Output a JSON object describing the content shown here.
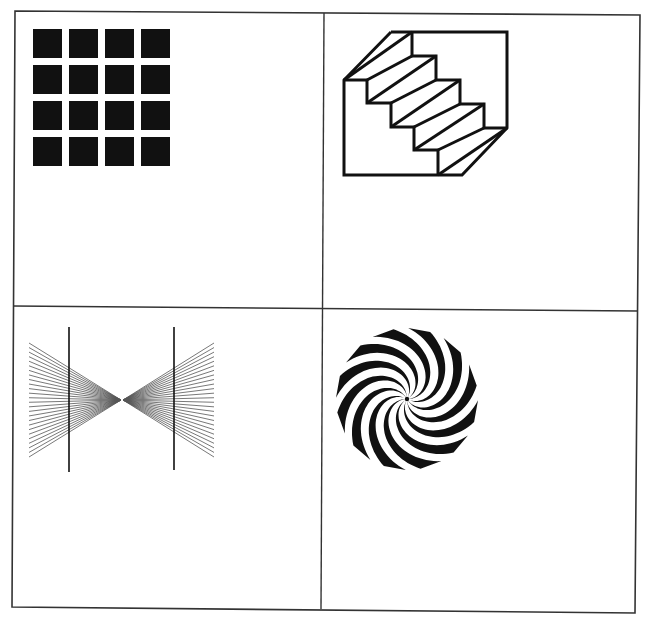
{
  "figure": {
    "title": "Four optical illusion figures",
    "panels": [
      {
        "id": "grid",
        "label": "Hermann grid illusion"
      },
      {
        "id": "staircase",
        "label": "Schroeder staircase illusion"
      },
      {
        "id": "fan",
        "label": "Hering illusion"
      },
      {
        "id": "spiral",
        "label": "Fraser spiral / twisted disk"
      }
    ]
  },
  "colors": {
    "ink": "#111111",
    "frame": "#333333",
    "fan_lines": "#555555",
    "background": "#ffffff"
  },
  "frame": {
    "corners": [
      [
        15,
        11
      ],
      [
        640,
        15
      ],
      [
        635,
        613
      ],
      [
        12,
        607
      ]
    ],
    "vertical_divider": [
      [
        324,
        13
      ],
      [
        321,
        609
      ]
    ],
    "horizontal_divider": [
      [
        13,
        306
      ],
      [
        638,
        311
      ]
    ],
    "underline": {
      "from": [
        10,
        617
      ],
      "to": [
        480,
        617
      ],
      "width": 3
    }
  },
  "grid_figure": {
    "rows": 4,
    "cols": 4,
    "origin": [
      33,
      29
    ],
    "square_size": 29,
    "step": 36
  },
  "staircase_figure": {
    "outline": [
      [
        391,
        32
      ],
      [
        507,
        32
      ],
      [
        507,
        128
      ],
      [
        462,
        175
      ],
      [
        344,
        175
      ],
      [
        344,
        80
      ],
      [
        391,
        32
      ]
    ],
    "steps_profile": [
      [
        344,
        80
      ],
      [
        367,
        80
      ],
      [
        367,
        103
      ],
      [
        391,
        103
      ],
      [
        391,
        127
      ],
      [
        414,
        127
      ],
      [
        414,
        150
      ],
      [
        438,
        150
      ],
      [
        438,
        175
      ]
    ],
    "back_profile": [
      [
        412,
        32
      ],
      [
        412,
        56
      ],
      [
        436,
        56
      ],
      [
        436,
        80
      ],
      [
        460,
        80
      ],
      [
        460,
        104
      ],
      [
        484,
        104
      ],
      [
        484,
        128
      ],
      [
        507,
        128
      ]
    ],
    "stroke_width": 3
  },
  "fan_figure": {
    "vertical_lines": [
      {
        "x": 69,
        "y1": 327,
        "y2": 472
      },
      {
        "x": 174,
        "y1": 327,
        "y2": 470
      }
    ],
    "left_fan": {
      "apex": [
        121,
        400
      ],
      "far_x": 29,
      "y_top": 343,
      "y_bottom": 457,
      "count": 26
    },
    "right_fan": {
      "apex": [
        123,
        400
      ],
      "far_x": 214,
      "y_top": 343,
      "y_bottom": 457,
      "count": 26
    }
  },
  "spiral_figure": {
    "center": [
      407,
      399
    ],
    "radius": 71,
    "arms": 12,
    "twist_degrees": -110,
    "outer_half_width_degrees": 9
  }
}
